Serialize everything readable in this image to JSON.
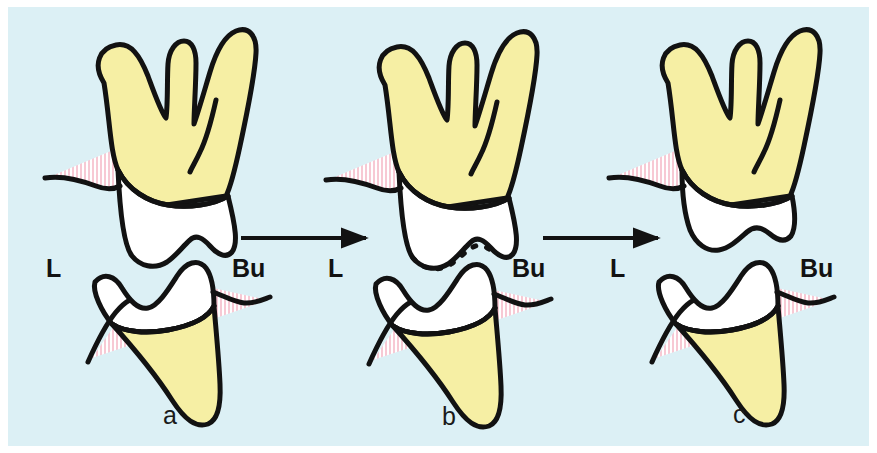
{
  "figure": {
    "background_color": "#DCF0F5",
    "border_color": "#FFFFFF"
  },
  "palette": {
    "background": "#DCF0F5",
    "enamel_white": "#FFFFFF",
    "dentin_yellow": "#F6EFA4",
    "gingiva_pink": "#F7C9D4",
    "outline_black": "#121212",
    "paper_white": "#FFFFFF"
  },
  "panels": [
    {
      "id": "panel-a",
      "caption": "a",
      "caption_x": 163,
      "caption_y": 424,
      "left_label": "L",
      "left_label_x": 46,
      "left_label_y": 277,
      "right_label": "Bu",
      "right_label_x": 232,
      "right_label_y": 277,
      "has_dashed_contour": false,
      "state": "teeth-in-contact"
    },
    {
      "id": "panel-b",
      "caption": "b",
      "caption_x": 442,
      "caption_y": 425,
      "left_label": "L",
      "left_label_x": 328,
      "left_label_y": 277,
      "right_label": "Bu",
      "right_label_x": 512,
      "right_label_y": 277,
      "has_dashed_contour": true,
      "state": "occlusal-reduction-outlined"
    },
    {
      "id": "panel-c",
      "caption": "c",
      "caption_x": 733,
      "caption_y": 423,
      "left_label": "L",
      "left_label_x": 610,
      "left_label_y": 277,
      "right_label": "Bu",
      "right_label_x": 800,
      "right_label_y": 277,
      "has_dashed_contour": false,
      "state": "teeth-separated"
    }
  ],
  "arrows": [
    {
      "id": "arrow-a-to-b",
      "x1": 241,
      "x2": 372,
      "y": 238
    },
    {
      "id": "arrow-b-to-c",
      "x1": 543,
      "x2": 664,
      "y": 238
    }
  ],
  "legend": {
    "L": "Lingual",
    "Bu": "Buccal"
  }
}
